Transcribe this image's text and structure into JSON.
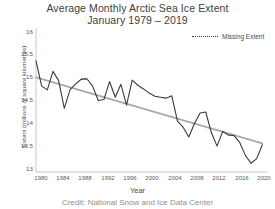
{
  "chart_data": {
    "type": "line",
    "title": "Average Monthly Arctic Sea Ice Extent",
    "subtitle": "January 1979 – 2019",
    "xlabel": "Year",
    "ylabel": "Extent (millions of square kilometres)",
    "credit": "Credit: National Snow and Ice Data Center",
    "xlim": [
      1979,
      2020
    ],
    "ylim": [
      13,
      16
    ],
    "grid": false,
    "legend_position": "top-right",
    "legend": [
      {
        "label": "Missing Extent",
        "style": "dotted",
        "color": "#3a3a3a"
      }
    ],
    "yticks": [
      16,
      15.5,
      15,
      14.5,
      14,
      13.5,
      13
    ],
    "ytick_labels": [
      "16",
      "15.5",
      "15",
      "14.5",
      "14",
      "13.5",
      "13"
    ],
    "xticks": [
      1980,
      1984,
      1988,
      1992,
      1996,
      2000,
      2004,
      2008,
      2012,
      2016,
      2020
    ],
    "xtick_labels": [
      "1980",
      "1984",
      "1988",
      "1992",
      "1996",
      "2000",
      "2004",
      "2008",
      "2012",
      "2016",
      "2020"
    ],
    "series": [
      {
        "name": "January Arctic Sea Ice Extent",
        "color": "#3a3a3a",
        "style": "solid",
        "x": [
          1979,
          1980,
          1981,
          1982,
          1983,
          1984,
          1985,
          1986,
          1987,
          1988,
          1989,
          1990,
          1991,
          1992,
          1993,
          1994,
          1995,
          1996,
          1997,
          1998,
          1999,
          2000,
          2001,
          2002,
          2003,
          2004,
          2005,
          2006,
          2007,
          2008,
          2009,
          2010,
          2011,
          2012,
          2013,
          2014,
          2015,
          2016,
          2017,
          2018,
          2019
        ],
        "values": [
          15.41,
          14.86,
          14.78,
          15.18,
          14.98,
          14.38,
          14.78,
          14.91,
          15.01,
          15.02,
          14.86,
          14.55,
          14.57,
          14.96,
          14.62,
          14.9,
          14.45,
          14.99,
          14.88,
          14.8,
          14.71,
          14.64,
          14.62,
          14.6,
          14.65,
          14.1,
          13.97,
          13.76,
          14.05,
          14.28,
          14.3,
          13.85,
          13.56,
          13.88,
          13.8,
          13.79,
          13.64,
          13.36,
          13.19,
          13.29,
          13.59
        ]
      },
      {
        "name": "Trend",
        "color": "#a8a8a8",
        "style": "solid",
        "x": [
          1979,
          2019
        ],
        "values": [
          15.05,
          13.62
        ]
      },
      {
        "name": "Missing Extent",
        "color": "#3a3a3a",
        "style": "dotted",
        "x": [
          1987,
          1988
        ],
        "values": [
          15.01,
          15.02
        ]
      }
    ]
  }
}
